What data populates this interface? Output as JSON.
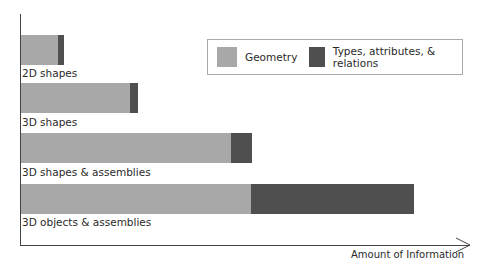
{
  "chart_data": {
    "type": "bar",
    "orientation": "horizontal",
    "stacked": true,
    "title": "",
    "xlabel": "Amount of Information",
    "ylabel": "",
    "categories": [
      "2D shapes",
      "3D shapes",
      "3D shapes & assemblies",
      "3D objects & assemblies"
    ],
    "series": [
      {
        "name": "Geometry",
        "color": "#a8a8a8",
        "values": [
          37,
          109,
          210,
          230
        ]
      },
      {
        "name": "Types, attributes, & relations",
        "color": "#4f4f4f",
        "values": [
          6,
          8,
          21,
          163
        ]
      }
    ],
    "units": "relative (pixel-scale, no numeric ticks shown)",
    "grid": false,
    "legend_position": "top-right"
  },
  "legend": {
    "items": [
      {
        "label": "Geometry",
        "color": "#a8a8a8"
      },
      {
        "label": "Types, attributes, & relations",
        "color": "#4f4f4f"
      }
    ]
  },
  "axis": {
    "x_label": "Amount of Information"
  },
  "bars": [
    {
      "label": "2D shapes",
      "geometry": 37,
      "types": 6
    },
    {
      "label": "3D shapes",
      "geometry": 109,
      "types": 8
    },
    {
      "label": "3D shapes & assemblies",
      "geometry": 210,
      "types": 21
    },
    {
      "label": "3D objects & assemblies",
      "geometry": 230,
      "types": 163
    }
  ]
}
